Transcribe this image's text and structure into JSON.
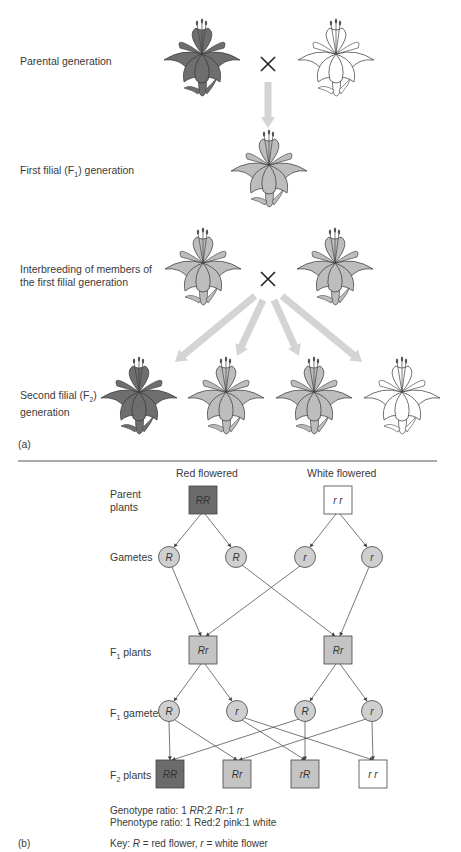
{
  "part_a": {
    "label": "(a)",
    "rows": {
      "parental": "Parental generation",
      "f1_prefix": "First filial (F",
      "f1_sub": "1",
      "f1_suffix": ") generation",
      "interbreed_line1": "Interbreeding of members of",
      "interbreed_line2": "the first filial generation",
      "f2_prefix": "Second filial (F",
      "f2_sub": "2",
      "f2_suffix": ")",
      "f2_line2": "generation"
    },
    "cross_symbol": "×",
    "flowers": {
      "parental": [
        "red",
        "white"
      ],
      "f1": [
        "pink"
      ],
      "interbreed": [
        "pink",
        "pink"
      ],
      "f2": [
        "red",
        "pink",
        "pink",
        "white"
      ]
    },
    "colors": {
      "red": "#6e6e6e",
      "pink": "#bdbdbd",
      "white": "#ffffff",
      "arrow": "#d4d4d4"
    }
  },
  "part_b": {
    "label": "(b)",
    "headers": {
      "red": "Red flowered",
      "white": "White flowered"
    },
    "row_labels": {
      "parent_line1": "Parent",
      "parent_line2": "plants",
      "gametes": "Gametes",
      "f1_plants_pre": "F",
      "f1_plants_sub": "1",
      "f1_plants_post": " plants",
      "f1_gametes_pre": "F",
      "f1_gametes_sub": "1",
      "f1_gametes_post": " gametes",
      "f2_plants_pre": "F",
      "f2_plants_sub": "2",
      "f2_plants_post": " plants"
    },
    "parents": [
      {
        "genotype": "RR",
        "fill": "#6b6b6b"
      },
      {
        "genotype": "r r",
        "fill": "#ffffff"
      }
    ],
    "gametes": [
      "R",
      "R",
      "r",
      "r"
    ],
    "f1_plants": [
      {
        "genotype": "Rr",
        "fill": "#c4c4c4"
      },
      {
        "genotype": "Rr",
        "fill": "#c4c4c4"
      }
    ],
    "f1_gametes": [
      "R",
      "r",
      "R",
      "r"
    ],
    "f2_plants": [
      {
        "genotype": "RR",
        "fill": "#6b6b6b"
      },
      {
        "genotype": "Rr",
        "fill": "#c4c4c4"
      },
      {
        "genotype": "rR",
        "fill": "#c4c4c4"
      },
      {
        "genotype": "r r",
        "fill": "#ffffff"
      }
    ],
    "gamete_fill": "#cfcfcf",
    "genotype_ratio_label": "Genotype ratio: 1 ",
    "genotype_ratio": [
      "RR",
      ":2 ",
      "Rr",
      ":1 ",
      "rr"
    ],
    "phenotype_ratio": "Phenotype ratio: 1 Red:2 pink:1 white",
    "key_prefix": "Key: ",
    "key_R": "R",
    "key_mid": " = red flower, ",
    "key_r": "r",
    "key_suffix": " = white flower"
  }
}
